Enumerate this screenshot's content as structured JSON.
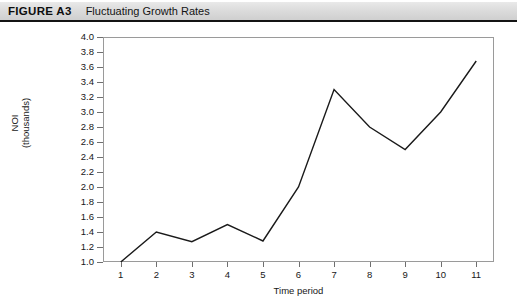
{
  "header": {
    "figure_label": "FIGURE A3",
    "figure_title": "Fluctuating Growth Rates",
    "bar_color": "#dcdcdc",
    "rule_color": "#141414"
  },
  "chart_data": {
    "type": "line",
    "title": "Fluctuating Growth Rates",
    "xlabel": "Time period",
    "ylabel": "NOI (thousands)",
    "ylabel_line1": "NOI",
    "ylabel_line2": "(thousands)",
    "x": [
      1,
      2,
      3,
      4,
      5,
      6,
      7,
      8,
      9,
      10,
      11
    ],
    "values": [
      1.0,
      1.4,
      1.27,
      1.5,
      1.28,
      2.0,
      3.3,
      2.8,
      2.5,
      3.0,
      3.68
    ],
    "categories": [
      "1",
      "2",
      "3",
      "4",
      "5",
      "6",
      "7",
      "8",
      "9",
      "10",
      "11"
    ],
    "xtick_labels": [
      "1",
      "2",
      "3",
      "4",
      "5",
      "6",
      "7",
      "8",
      "9",
      "10",
      "11"
    ],
    "ytick_labels": [
      "4.0",
      "3.8",
      "3.6",
      "3.4",
      "3.2",
      "3.0",
      "2.8",
      "2.6",
      "2.4",
      "2.2",
      "2.0",
      "1.8",
      "1.6",
      "1.4",
      "1.2",
      "1.0"
    ],
    "ytick_values": [
      4.0,
      3.8,
      3.6,
      3.4,
      3.2,
      3.0,
      2.8,
      2.6,
      2.4,
      2.2,
      2.0,
      1.8,
      1.6,
      1.4,
      1.2,
      1.0
    ],
    "ylim": [
      1.0,
      4.0
    ],
    "xlim": [
      0.5,
      11.5
    ],
    "grid": false,
    "legend": false,
    "line_color": "#1a1a1a",
    "line_width": 1.4,
    "markers": false,
    "frame_color": "#9a9a9a",
    "background": "#ffffff"
  }
}
